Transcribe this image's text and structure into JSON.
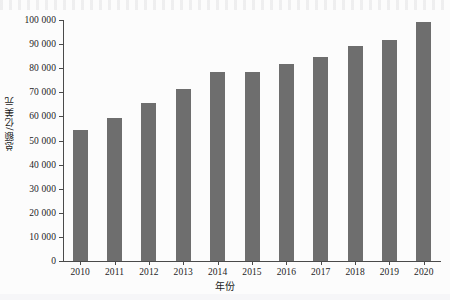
{
  "figure": {
    "background_color": "#fcfcfc",
    "bar_color": "#6e6e6e",
    "axis_color": "#4a4a4a"
  },
  "chart_data": {
    "type": "bar",
    "title": "",
    "subtitle": "",
    "xlabel": "年份",
    "ylabel": "总额/亿美元",
    "categories": [
      "2010",
      "2011",
      "2012",
      "2013",
      "2014",
      "2015",
      "2016",
      "2017",
      "2018",
      "2019",
      "2020"
    ],
    "values": [
      54400,
      59300,
      65500,
      71500,
      78300,
      78400,
      81800,
      84500,
      89400,
      91800,
      99000
    ],
    "ylim": [
      0,
      100000
    ],
    "ytick_values": [
      0,
      10000,
      20000,
      30000,
      40000,
      50000,
      60000,
      70000,
      80000,
      90000,
      100000
    ],
    "ytick_labels": [
      "0",
      "10 000",
      "20 000",
      "30 000",
      "40 000",
      "50 000",
      "60 000",
      "70 000",
      "80 000",
      "90 000",
      "100 000"
    ],
    "grid": false,
    "legend": null,
    "legend_position": "none",
    "series": [
      {
        "name": "总额",
        "values": [
          54400,
          59300,
          65500,
          71500,
          78300,
          78400,
          81800,
          84500,
          89400,
          91800,
          99000
        ]
      }
    ]
  }
}
